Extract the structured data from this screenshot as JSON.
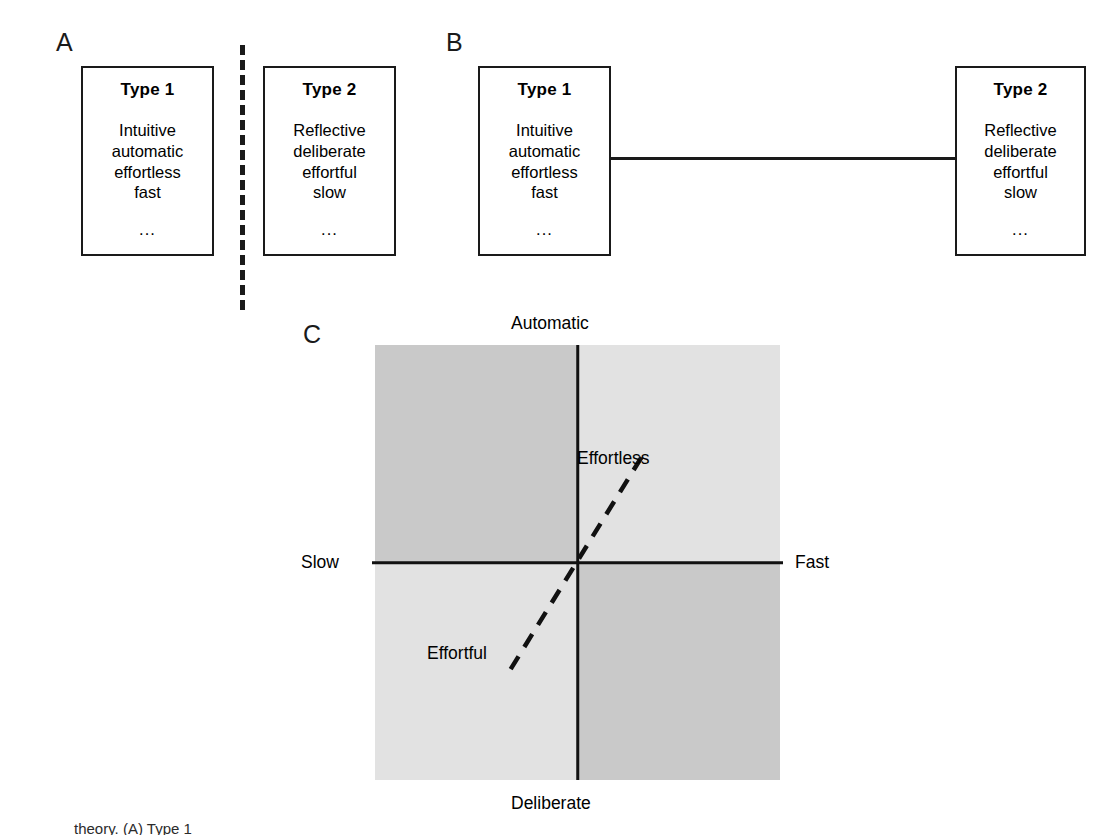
{
  "figure": {
    "panels": [
      {
        "letter": "A",
        "relation": "dashed-separator",
        "boxes": [
          {
            "title": "Type 1",
            "attributes": [
              "Intuitive",
              "automatic",
              "effortless",
              "fast"
            ],
            "ellipsis": "..."
          },
          {
            "title": "Type 2",
            "attributes": [
              "Reflective",
              "deliberate",
              "effortful",
              "slow"
            ],
            "ellipsis": "..."
          }
        ]
      },
      {
        "letter": "B",
        "relation": "solid-connector",
        "boxes": [
          {
            "title": "Type 1",
            "attributes": [
              "Intuitive",
              "automatic",
              "effortless",
              "fast"
            ],
            "ellipsis": "..."
          },
          {
            "title": "Type 2",
            "attributes": [
              "Reflective",
              "deliberate",
              "effortful",
              "slow"
            ],
            "ellipsis": "..."
          }
        ]
      },
      {
        "letter": "C",
        "relation": "quadrant-space"
      }
    ]
  },
  "chart_data": {
    "type": "scatter",
    "title": "",
    "subtitle": "",
    "xlabel": "",
    "ylabel": "",
    "axis_labels": {
      "top": "Automatic",
      "bottom": "Deliberate",
      "left": "Slow",
      "right": "Fast"
    },
    "axis_ranges": {
      "x": [
        "Slow",
        "Fast"
      ],
      "y": [
        "Deliberate",
        "Automatic"
      ]
    },
    "grid": false,
    "legend": "none",
    "origin": {
      "x": 0.5,
      "y": 0.5
    },
    "quadrants": [
      {
        "name": "top-left",
        "x": "Slow",
        "y": "Automatic",
        "shade": "dark",
        "color": "#c9c9c9"
      },
      {
        "name": "top-right",
        "x": "Fast",
        "y": "Automatic",
        "shade": "light",
        "color": "#e2e2e2"
      },
      {
        "name": "bottom-left",
        "x": "Slow",
        "y": "Deliberate",
        "shade": "light",
        "color": "#e2e2e2"
      },
      {
        "name": "bottom-right",
        "x": "Fast",
        "y": "Deliberate",
        "shade": "dark",
        "color": "#c9c9c9"
      }
    ],
    "annotations": [
      {
        "label": "Effortless",
        "quadrant": "top-right",
        "line": "dashed",
        "from": [
          0.5,
          0.5
        ],
        "to": [
          0.66,
          0.255
        ]
      },
      {
        "label": "Effortful",
        "quadrant": "bottom-left",
        "line": "dashed",
        "from": [
          0.5,
          0.5
        ],
        "to": [
          0.335,
          0.745
        ]
      }
    ],
    "diagonal": {
      "style": "dashed",
      "color": "#111111",
      "width": 4.5,
      "description": "dashed diagonal axis running from Effortful (lower-left) through the origin to Effortless (upper-right)"
    }
  },
  "caption": {
    "visible_fragment": "theory. (A) Type 1",
    "note": "bottom caption line is cropped by the image edge and only partially legible"
  },
  "colors": {
    "ink": "#111111",
    "paper": "#ffffff",
    "quadrant_dark": "#c9c9c9",
    "quadrant_light": "#e2e2e2"
  }
}
